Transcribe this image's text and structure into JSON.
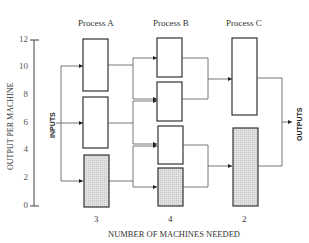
{
  "diagram": {
    "processes": [
      {
        "label": "Process A",
        "machines_needed": "3"
      },
      {
        "label": "Process B",
        "machines_needed": "4"
      },
      {
        "label": "Process C",
        "machines_needed": "2"
      }
    ],
    "y_axis": {
      "label": "OUTPUT PER MACHINE",
      "ticks": [
        "12",
        "10",
        "8",
        "6",
        "4",
        "2",
        "0"
      ]
    },
    "x_axis": {
      "label": "NUMBER OF MACHINES NEEDED"
    },
    "inputs_label": "INPUTS",
    "outputs_label": "OUTPUTS",
    "colors": {
      "line": "#444444",
      "box_fill": "#ffffff",
      "shaded_fill": "#d9d9d9"
    }
  }
}
